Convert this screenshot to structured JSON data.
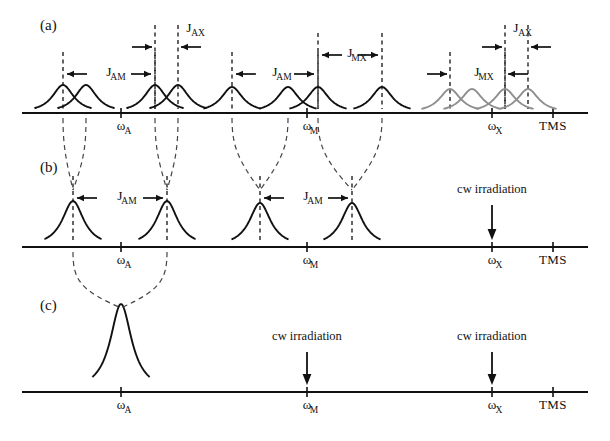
{
  "figure": {
    "width": 610,
    "height": 441,
    "background_color": "#ffffff",
    "line_color": "#111111",
    "decoupled_peak_color": "#8f8f8f",
    "dashed_color": "#444444"
  },
  "panels": [
    {
      "id": "a",
      "label": "(a)",
      "label_x": 40,
      "label_y": 30,
      "baseline_y": 113,
      "axis_x0": 22,
      "axis_x1": 588,
      "description": "Fully coupled AMX spectrum: three multiplets each split into four lines",
      "ticks": [
        {
          "name": "omega-A",
          "base": "ω",
          "sub": "A",
          "x": 121
        },
        {
          "name": "omega-M",
          "base": "ω",
          "sub": "M",
          "x": 307
        },
        {
          "name": "omega-X",
          "base": "ω",
          "sub": "X",
          "x": 492
        },
        {
          "name": "tms",
          "base": "TMS",
          "sub": "",
          "x": 553
        }
      ],
      "peaks": [
        {
          "x": 63,
          "height": 28,
          "width": 11,
          "color": "#111111",
          "group": "A"
        },
        {
          "x": 86,
          "height": 28,
          "width": 11,
          "color": "#111111",
          "group": "A"
        },
        {
          "x": 155,
          "height": 28,
          "width": 11,
          "color": "#111111",
          "group": "A"
        },
        {
          "x": 178,
          "height": 28,
          "width": 11,
          "color": "#111111",
          "group": "A"
        },
        {
          "x": 232,
          "height": 26,
          "width": 11,
          "color": "#111111",
          "group": "M"
        },
        {
          "x": 288,
          "height": 26,
          "width": 11,
          "color": "#111111",
          "group": "M"
        },
        {
          "x": 318,
          "height": 26,
          "width": 11,
          "color": "#111111",
          "group": "M"
        },
        {
          "x": 382,
          "height": 26,
          "width": 11,
          "color": "#111111",
          "group": "M"
        },
        {
          "x": 450,
          "height": 24,
          "width": 11,
          "color": "#8f8f8f",
          "group": "X"
        },
        {
          "x": 472,
          "height": 24,
          "width": 11,
          "color": "#8f8f8f",
          "group": "X"
        },
        {
          "x": 505,
          "height": 24,
          "width": 11,
          "color": "#8f8f8f",
          "group": "X"
        },
        {
          "x": 528,
          "height": 24,
          "width": 11,
          "color": "#8f8f8f",
          "group": "X"
        }
      ],
      "couplings": [
        {
          "name": "J_AM-left",
          "base": "J",
          "sub": "AM",
          "x1": 63,
          "x2": 155,
          "y": 74,
          "label_x": 109,
          "label_y": 76,
          "direction": "inward"
        },
        {
          "name": "J_AX-left",
          "base": "J",
          "sub": "AX",
          "x1": 155,
          "x2": 178,
          "y": 47,
          "label_x": 189,
          "label_y": 32,
          "direction": "outward"
        },
        {
          "name": "J_AM-right",
          "base": "J",
          "sub": "AM",
          "x1": 232,
          "x2": 318,
          "y": 74,
          "label_x": 275,
          "label_y": 76,
          "direction": "inward"
        },
        {
          "name": "J_MX",
          "base": "J",
          "sub": "MX",
          "x1": 318,
          "x2": 382,
          "y": 55,
          "label_x": 350,
          "label_y": 57,
          "direction": "inward"
        },
        {
          "name": "J_MX-x",
          "base": "J",
          "sub": "MX",
          "x1": 450,
          "x2": 505,
          "y": 74,
          "label_x": 477,
          "label_y": 76,
          "direction": "outward"
        },
        {
          "name": "J_AX-x",
          "base": "J",
          "sub": "AX",
          "x1": 505,
          "x2": 528,
          "y": 47,
          "label_x": 516,
          "label_y": 32,
          "direction": "outward"
        }
      ]
    },
    {
      "id": "b",
      "label": "(b)",
      "label_x": 40,
      "label_y": 172,
      "baseline_y": 247,
      "axis_x0": 22,
      "axis_x1": 588,
      "description": "X nucleus irradiated: A and M multiplets collapse to doublets",
      "ticks": [
        {
          "name": "omega-A",
          "base": "ω",
          "sub": "A",
          "x": 121
        },
        {
          "name": "omega-M",
          "base": "ω",
          "sub": "M",
          "x": 307
        },
        {
          "name": "omega-X",
          "base": "ω",
          "sub": "X",
          "x": 492
        },
        {
          "name": "tms",
          "base": "TMS",
          "sub": "",
          "x": 553
        }
      ],
      "peaks": [
        {
          "x": 73,
          "height": 46,
          "width": 11,
          "color": "#111111",
          "group": "A"
        },
        {
          "x": 167,
          "height": 46,
          "width": 11,
          "color": "#111111",
          "group": "A"
        },
        {
          "x": 260,
          "height": 44,
          "width": 11,
          "color": "#111111",
          "group": "M"
        },
        {
          "x": 352,
          "height": 44,
          "width": 11,
          "color": "#111111",
          "group": "M"
        }
      ],
      "couplings": [
        {
          "name": "J_AM-left",
          "base": "J",
          "sub": "AM",
          "x1": 73,
          "x2": 167,
          "y": 198,
          "label_x": 120,
          "label_y": 200,
          "direction": "inward"
        },
        {
          "name": "J_AM-right",
          "base": "J",
          "sub": "AM",
          "x1": 260,
          "x2": 352,
          "y": 198,
          "label_x": 306,
          "label_y": 200,
          "direction": "inward"
        }
      ],
      "irradiations": [
        {
          "name": "cw-irradiation-X",
          "label": "cw irradiation",
          "x": 492,
          "label_y": 193,
          "arrow_top": 205,
          "arrow_bottom": 240
        }
      ]
    },
    {
      "id": "c",
      "label": "(c)",
      "label_x": 40,
      "label_y": 310,
      "baseline_y": 392,
      "axis_x0": 22,
      "axis_x1": 588,
      "description": "Both M and X irradiated: A resonance collapses to a single line",
      "ticks": [
        {
          "name": "omega-A",
          "base": "ω",
          "sub": "A",
          "x": 121
        },
        {
          "name": "omega-M",
          "base": "ω",
          "sub": "M",
          "x": 307
        },
        {
          "name": "omega-X",
          "base": "ω",
          "sub": "X",
          "x": 492
        },
        {
          "name": "tms",
          "base": "TMS",
          "sub": "",
          "x": 553
        }
      ],
      "peaks": [
        {
          "x": 121,
          "height": 88,
          "width": 11,
          "color": "#111111",
          "group": "A"
        }
      ],
      "couplings": [],
      "irradiations": [
        {
          "name": "cw-irradiation-M",
          "label": "cw irradiation",
          "x": 307,
          "label_y": 340,
          "arrow_top": 352,
          "arrow_bottom": 385
        },
        {
          "name": "cw-irradiation-X",
          "label": "cw irradiation",
          "x": 492,
          "label_y": 340,
          "arrow_top": 352,
          "arrow_bottom": 385
        }
      ]
    }
  ],
  "correlations": [
    {
      "from": [
        63,
        118
      ],
      "to": [
        73,
        190
      ],
      "mid": [
        66,
        160
      ]
    },
    {
      "from": [
        86,
        118
      ],
      "to": [
        73,
        190
      ],
      "mid": [
        84,
        160
      ]
    },
    {
      "from": [
        155,
        118
      ],
      "to": [
        167,
        190
      ],
      "mid": [
        158,
        160
      ]
    },
    {
      "from": [
        178,
        118
      ],
      "to": [
        167,
        190
      ],
      "mid": [
        176,
        160
      ]
    },
    {
      "from": [
        232,
        118
      ],
      "to": [
        260,
        190
      ],
      "mid": [
        238,
        160
      ]
    },
    {
      "from": [
        288,
        118
      ],
      "to": [
        260,
        190
      ],
      "mid": [
        282,
        160
      ]
    },
    {
      "from": [
        318,
        118
      ],
      "to": [
        352,
        190
      ],
      "mid": [
        325,
        160
      ]
    },
    {
      "from": [
        382,
        118
      ],
      "to": [
        352,
        190
      ],
      "mid": [
        375,
        160
      ]
    },
    {
      "from": [
        73,
        252
      ],
      "to": [
        121,
        308
      ],
      "mid": [
        80,
        290
      ]
    },
    {
      "from": [
        167,
        252
      ],
      "to": [
        121,
        308
      ],
      "mid": [
        160,
        290
      ]
    }
  ]
}
